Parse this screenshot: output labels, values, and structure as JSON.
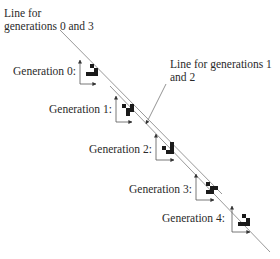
{
  "annotations": {
    "line_0_3": {
      "line1": "Line for",
      "line2": "generations 0 and 3"
    },
    "line_1_2": {
      "line1": "Line for generations 1",
      "line2": "and 2"
    }
  },
  "generations": [
    {
      "label": "Generation 0:"
    },
    {
      "label": "Generation 1:"
    },
    {
      "label": "Generation 2:"
    },
    {
      "label": "Generation 3:"
    },
    {
      "label": "Generation 4:"
    }
  ],
  "colors": {
    "cell": "#1a1a1a",
    "line": "#888888",
    "axis": "#555555"
  }
}
